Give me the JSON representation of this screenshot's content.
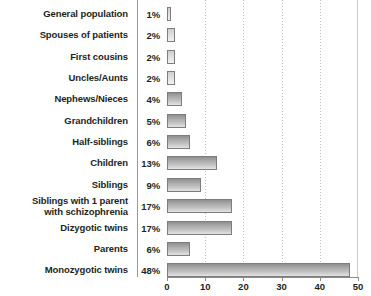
{
  "chart_data": {
    "type": "bar",
    "orientation": "horizontal",
    "title": "",
    "xlabel": "",
    "ylabel": "",
    "xlim": [
      0,
      50
    ],
    "xticks": [
      0,
      10,
      20,
      30,
      40,
      50
    ],
    "grid": true,
    "gridlines_at": [
      10,
      20,
      30,
      40
    ],
    "legend": "none",
    "value_label_suffix": "%",
    "categories": [
      "General population",
      "Spouses of patients",
      "First cousins",
      "Uncles/Aunts",
      "Nephews/Nieces",
      "Grandchildren",
      "Half-siblings",
      "Children",
      "Siblings",
      "Siblings with 1 parent with schizophrenia",
      "Dizygotic twins",
      "Parents",
      "Monozygotic twins"
    ],
    "values": [
      1,
      2,
      2,
      2,
      4,
      5,
      6,
      13,
      9,
      17,
      17,
      6,
      48
    ],
    "value_labels": [
      "1%",
      "2%",
      "2%",
      "2%",
      "4%",
      "5%",
      "6%",
      "13%",
      "9%",
      "17%",
      "17%",
      "6%",
      "48%"
    ]
  },
  "rows": [
    {
      "label_line1": "General population",
      "label_line2": "",
      "pct": "1%",
      "value": 1
    },
    {
      "label_line1": "Spouses of patients",
      "label_line2": "",
      "pct": "2%",
      "value": 2
    },
    {
      "label_line1": "First cousins",
      "label_line2": "",
      "pct": "2%",
      "value": 2
    },
    {
      "label_line1": "Uncles/Aunts",
      "label_line2": "",
      "pct": "2%",
      "value": 2
    },
    {
      "label_line1": "Nephews/Nieces",
      "label_line2": "",
      "pct": "4%",
      "value": 4
    },
    {
      "label_line1": "Grandchildren",
      "label_line2": "",
      "pct": "5%",
      "value": 5
    },
    {
      "label_line1": "Half-siblings",
      "label_line2": "",
      "pct": "6%",
      "value": 6
    },
    {
      "label_line1": "Children",
      "label_line2": "",
      "pct": "13%",
      "value": 13
    },
    {
      "label_line1": "Siblings",
      "label_line2": "",
      "pct": "9%",
      "value": 9
    },
    {
      "label_line1": "Siblings with 1 parent",
      "label_line2": "with schizophrenia",
      "pct": "17%",
      "value": 17
    },
    {
      "label_line1": "Dizygotic twins",
      "label_line2": "",
      "pct": "17%",
      "value": 17
    },
    {
      "label_line1": "Parents",
      "label_line2": "",
      "pct": "6%",
      "value": 6
    },
    {
      "label_line1": "Monozygotic twins",
      "label_line2": "",
      "pct": "48%",
      "value": 48
    }
  ],
  "axis": {
    "ticks": [
      "0",
      "10",
      "20",
      "30",
      "40",
      "50"
    ]
  },
  "colors": {
    "text": "#231f20",
    "bar_border": "#7d7d7d",
    "bar_fill_dark": "#8f8f8f",
    "bar_fill_light": "#e3e3e3",
    "gridline": "#bdbdbd",
    "divider": "#9a9a9a",
    "axis": "#8a8a8a",
    "background": "#ffffff"
  }
}
